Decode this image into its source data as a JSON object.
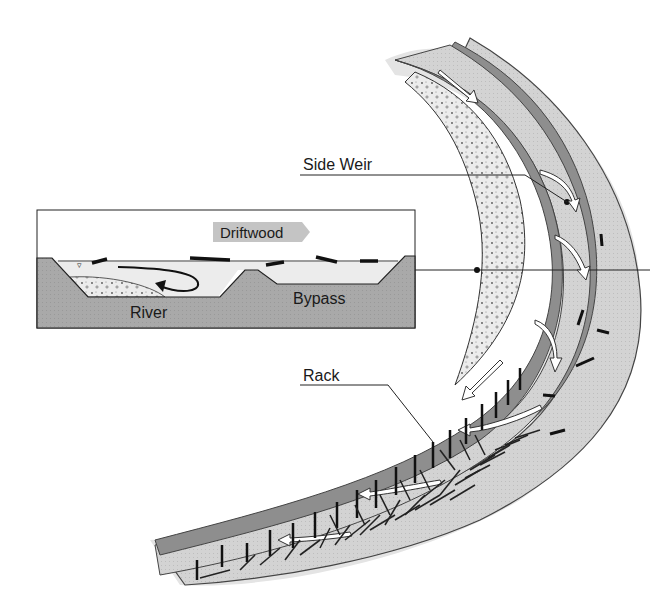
{
  "diagram": {
    "type": "schematic",
    "labels": {
      "side_weir": "Side Weir",
      "rack": "Rack",
      "driftwood": "Driftwood",
      "river": "River",
      "bypass": "Bypass"
    },
    "inset": {
      "title": "Cross-section",
      "channels": [
        "River",
        "Bypass"
      ],
      "flow_label": "Driftwood"
    },
    "colors": {
      "bank_dark": "#8c8c8c",
      "channel_light": "#cfcfcf",
      "water_fill": "#ececec",
      "ground": "#a8a8a8",
      "outline": "#1a1a1a",
      "arrow_fill": "#ffffff",
      "tag_fill": "#c4c4c4"
    }
  }
}
